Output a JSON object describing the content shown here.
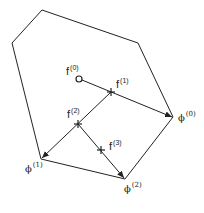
{
  "diagram": {
    "stroke_color": "#222222",
    "polygon_vertices": [
      [
        42,
        10
      ],
      [
        138,
        43
      ],
      [
        173,
        117
      ],
      [
        125,
        179
      ],
      [
        41,
        159
      ],
      [
        12,
        43
      ]
    ],
    "points": {
      "f0": {
        "label": "f",
        "sup": "(0)",
        "x": 79,
        "y": 79,
        "marker": "circle"
      },
      "f1": {
        "label": "f",
        "sup": "(1)",
        "x": 111,
        "y": 92,
        "marker": "cross"
      },
      "f2": {
        "label": "f",
        "sup": "(2)",
        "x": 78,
        "y": 124,
        "marker": "cross"
      },
      "f3": {
        "label": "f",
        "sup": "(3)",
        "x": 101,
        "y": 150,
        "marker": "cross"
      }
    },
    "vertices_labeled": {
      "phi0": {
        "label": "ϕ",
        "sup": "(0)",
        "x": 173,
        "y": 117
      },
      "phi1": {
        "label": "ϕ",
        "sup": "(1)",
        "x": 41,
        "y": 159
      },
      "phi2": {
        "label": "ϕ",
        "sup": "(2)",
        "x": 125,
        "y": 179
      }
    },
    "arrows": [
      {
        "from": "f0",
        "to": "phi0"
      },
      {
        "from": "f1",
        "to": "phi1"
      },
      {
        "from": "f2",
        "to": "phi2"
      }
    ]
  }
}
